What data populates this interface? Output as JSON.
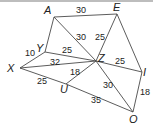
{
  "diagram": {
    "type": "weighted-graph",
    "vertices": [
      {
        "id": "A",
        "label": "A",
        "x": 54,
        "y": 17,
        "lx": 44,
        "ly": 14
      },
      {
        "id": "E",
        "label": "E",
        "x": 117,
        "y": 14,
        "lx": 113,
        "ly": 11
      },
      {
        "id": "Y",
        "label": "Y",
        "x": 45,
        "y": 52,
        "lx": 36,
        "ly": 52
      },
      {
        "id": "X",
        "label": "X",
        "x": 20,
        "y": 68,
        "lx": 7,
        "ly": 72
      },
      {
        "id": "Z",
        "label": "Z",
        "x": 96,
        "y": 61,
        "lx": 98,
        "ly": 62
      },
      {
        "id": "U",
        "label": "U",
        "x": 66,
        "y": 84,
        "lx": 60,
        "ly": 93
      },
      {
        "id": "I",
        "label": "I",
        "x": 142,
        "y": 72,
        "lx": 143,
        "ly": 76
      },
      {
        "id": "O",
        "label": "O",
        "x": 133,
        "y": 112,
        "lx": 129,
        "ly": 123
      }
    ],
    "edges": [
      {
        "from": "A",
        "to": "E",
        "weight": "30",
        "lx": 76,
        "ly": 13
      },
      {
        "from": "A",
        "to": "Z",
        "weight": "30",
        "lx": 76,
        "ly": 40
      },
      {
        "from": "A",
        "to": "Y",
        "weight": "",
        "lx": 0,
        "ly": 0
      },
      {
        "from": "E",
        "to": "Z",
        "weight": "25",
        "lx": 95,
        "ly": 40
      },
      {
        "from": "E",
        "to": "I",
        "weight": "",
        "lx": 0,
        "ly": 0
      },
      {
        "from": "Y",
        "to": "X",
        "weight": "10",
        "lx": 25,
        "ly": 56
      },
      {
        "from": "Y",
        "to": "Z",
        "weight": "25",
        "lx": 62,
        "ly": 53
      },
      {
        "from": "X",
        "to": "Z",
        "weight": "32",
        "lx": 50,
        "ly": 65
      },
      {
        "from": "X",
        "to": "U",
        "weight": "25",
        "lx": 37,
        "ly": 84
      },
      {
        "from": "U",
        "to": "Z",
        "weight": "18",
        "lx": 70,
        "ly": 75
      },
      {
        "from": "U",
        "to": "O",
        "weight": "35",
        "lx": 91,
        "ly": 103
      },
      {
        "from": "Z",
        "to": "I",
        "weight": "25",
        "lx": 115,
        "ly": 64
      },
      {
        "from": "Z",
        "to": "O",
        "weight": "30",
        "lx": 103,
        "ly": 88
      },
      {
        "from": "I",
        "to": "O",
        "weight": "18",
        "lx": 140,
        "ly": 95
      }
    ],
    "colors": {
      "edge": "#4a4a4a",
      "text": "#222222",
      "topbar": "#bdbdbd"
    }
  }
}
